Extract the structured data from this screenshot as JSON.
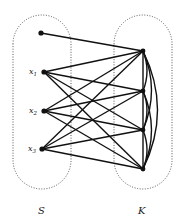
{
  "diagram": {
    "type": "bipartite-graph",
    "sets": [
      {
        "id": "S",
        "label": "S"
      },
      {
        "id": "K",
        "label": "K"
      }
    ],
    "nodes": {
      "S": [
        {
          "id": "s0",
          "label": ""
        },
        {
          "id": "x1",
          "label": "x",
          "subscript": "1"
        },
        {
          "id": "x2",
          "label": "x",
          "subscript": "2"
        },
        {
          "id": "x3",
          "label": "x",
          "subscript": "3"
        }
      ],
      "K": [
        {
          "id": "k1",
          "label": ""
        },
        {
          "id": "k2",
          "label": ""
        },
        {
          "id": "k3",
          "label": ""
        },
        {
          "id": "k4",
          "label": ""
        }
      ]
    },
    "edges": [
      [
        "s0",
        "k1"
      ],
      [
        "x1",
        "k1"
      ],
      [
        "x1",
        "k2"
      ],
      [
        "x1",
        "k3"
      ],
      [
        "x1",
        "k4"
      ],
      [
        "x2",
        "k1"
      ],
      [
        "x2",
        "k2"
      ],
      [
        "x2",
        "k3"
      ],
      [
        "x2",
        "k4"
      ],
      [
        "x3",
        "k1"
      ],
      [
        "x3",
        "k2"
      ],
      [
        "x3",
        "k3"
      ],
      [
        "x3",
        "k4"
      ],
      [
        "k1",
        "k2"
      ],
      [
        "k2",
        "k3"
      ],
      [
        "k3",
        "k4"
      ],
      [
        "k1",
        "k3"
      ],
      [
        "k2",
        "k4"
      ],
      [
        "k1",
        "k4"
      ]
    ],
    "colors": {
      "edge": "#111111",
      "outline": "#555555",
      "background": "#ffffff"
    }
  }
}
